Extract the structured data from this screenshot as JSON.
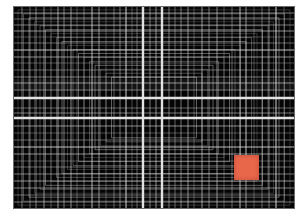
{
  "artwork": {
    "description": "Abstract black panel with dense white/gray perspective grid lines converging toward a central cross and a small orange square near the lower right",
    "background_color": "#050505",
    "line_color": "#e6e6e6",
    "accent": {
      "shape": "square",
      "color": "#e8664a",
      "x": 220,
      "y": 148,
      "size": 25
    },
    "main_lines": {
      "vertical": [
        129,
        148
      ],
      "horizontal": [
        91,
        111
      ]
    }
  }
}
